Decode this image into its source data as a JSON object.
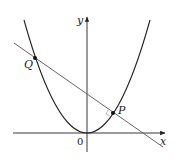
{
  "figure": {
    "axes": {
      "x_label": "x",
      "y_label": "y",
      "origin_label": "0"
    },
    "points": [
      {
        "name": "Q",
        "label": "Q",
        "x": 35,
        "y": 58
      },
      {
        "name": "P",
        "label": "P",
        "x": 113,
        "y": 113
      }
    ],
    "curves": [
      {
        "type": "parabola",
        "description": "upward parabola with vertex at origin"
      },
      {
        "type": "line",
        "description": "line through Q and P, normal to parabola at P"
      }
    ],
    "colors": {
      "ink": "#222222",
      "line": "#555555",
      "background": "#ffffff"
    }
  }
}
